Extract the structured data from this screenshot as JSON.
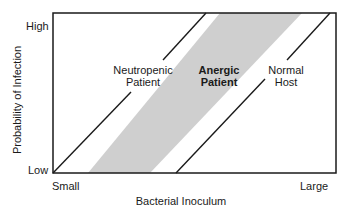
{
  "diagram": {
    "x_axis": {
      "label": "Bacterial Inoculum",
      "min_label": "Small",
      "max_label": "Large"
    },
    "y_axis": {
      "label": "Probability of Infection",
      "min_label": "Low",
      "max_label": "High"
    },
    "curves": [
      {
        "name": "neutropenic",
        "label_line1": "Neutropenic",
        "label_line2": "Patient",
        "style": "line"
      },
      {
        "name": "anergic",
        "label_line1": "Anergic",
        "label_line2": "Patient",
        "style": "shaded-band"
      },
      {
        "name": "normal",
        "label_line1": "Normal",
        "label_line2": "Host",
        "style": "line"
      }
    ],
    "colors": {
      "line": "#1a1a1a",
      "band": "#cfcfcf"
    }
  }
}
